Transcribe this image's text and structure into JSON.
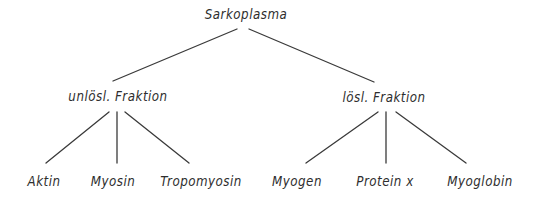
{
  "diagram": {
    "type": "tree",
    "root": {
      "label": "Sarkoplasma",
      "children": [
        {
          "label": "unlösl. Fraktion",
          "children": [
            {
              "label": "Aktin"
            },
            {
              "label": "Myosin"
            },
            {
              "label": "Tropomyosin"
            }
          ]
        },
        {
          "label": "lösl. Fraktion",
          "children": [
            {
              "label": "Myogen"
            },
            {
              "label": "Protein x"
            },
            {
              "label": "Myoglobin"
            }
          ]
        }
      ]
    }
  },
  "colors": {
    "line": "#3a3a3a",
    "text": "#2e2e2e",
    "background": "#ffffff"
  }
}
